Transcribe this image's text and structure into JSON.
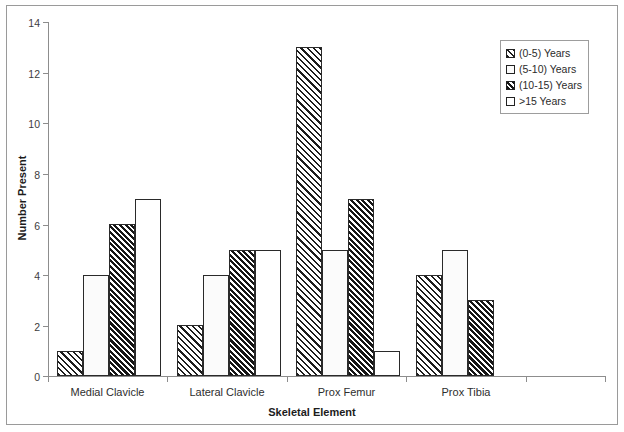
{
  "chart_data": {
    "type": "bar",
    "title": "",
    "xlabel": "Skeletal Element",
    "ylabel": "Number Present",
    "ylim": [
      0,
      14
    ],
    "yticks": [
      0,
      2,
      4,
      6,
      8,
      10,
      12,
      14
    ],
    "grid": false,
    "legend_position": "top-right",
    "categories": [
      "Medial Clavicle",
      "Lateral Clavicle",
      "Prox Femur",
      "Prox Tibia"
    ],
    "series": [
      {
        "name": "(0-5) Years",
        "pattern": "diagonal-hatch",
        "values": [
          1,
          2,
          13,
          4
        ]
      },
      {
        "name": "(5-10) Years",
        "pattern": "dotted",
        "values": [
          4,
          4,
          5,
          5
        ]
      },
      {
        "name": "(10-15) Years",
        "pattern": "dense-diagonal-hatch",
        "values": [
          6,
          5,
          7,
          3
        ]
      },
      {
        "name": ">15 Years",
        "pattern": "empty-white",
        "values": [
          7,
          5,
          1,
          0
        ]
      }
    ]
  },
  "axes": {
    "y_tick_labels": [
      "0",
      "2",
      "4",
      "6",
      "8",
      "10",
      "12",
      "14"
    ],
    "y_title": "Number Present",
    "x_title": "Skeletal Element",
    "x_tick_labels": [
      "Medial Clavicle",
      "Lateral Clavicle",
      "Prox Femur",
      "Prox Tibia"
    ]
  },
  "legend": {
    "items": [
      {
        "label": "(0-5) Years"
      },
      {
        "label": "(5-10) Years"
      },
      {
        "label": "(10-15) Years"
      },
      {
        "label": ">15 Years"
      }
    ]
  },
  "colors": {
    "axis": "#8d8d8d",
    "bar_outline": "#2a2a2a",
    "hatch": "#1d1d1d",
    "background": "#ffffff",
    "frame": "#9a9a9a"
  }
}
